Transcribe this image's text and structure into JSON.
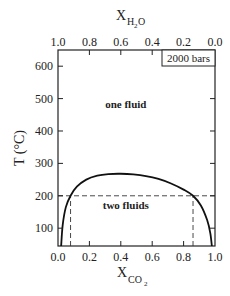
{
  "chart_data": {
    "type": "line",
    "title": "",
    "annotation_box": "2000 bars",
    "xlabel": "X_CO2",
    "xlabel_main": "X",
    "xlabel_sub": "CO",
    "xlabel_subsub": "2",
    "x2label": "X_H2O",
    "x2label_main": "X",
    "x2label_sub": "H",
    "x2label_subsub": "2",
    "x2label_sub_tail": "O",
    "ylabel": "T (°C)",
    "xlim": [
      0.0,
      1.0
    ],
    "ylim": [
      45,
      650
    ],
    "x_ticks": [
      0.0,
      0.2,
      0.4,
      0.6,
      0.8,
      1.0
    ],
    "x_tick_labels": [
      "0.0",
      "0.2",
      "0.4",
      "0.6",
      "0.8",
      "1.0"
    ],
    "x2_ticks": [
      1.0,
      0.8,
      0.6,
      0.4,
      0.2,
      0.0
    ],
    "x2_tick_labels": [
      "1.0",
      "0.8",
      "0.6",
      "0.4",
      "0.2",
      "0.0"
    ],
    "y_ticks": [
      100,
      200,
      300,
      400,
      500,
      600
    ],
    "y_tick_labels": [
      "100",
      "200",
      "300",
      "400",
      "500",
      "600"
    ],
    "grid": false,
    "regions": [
      {
        "label": "one fluid",
        "x": 0.4,
        "y": 470
      },
      {
        "label": "two fluids",
        "x": 0.4,
        "y": 160
      }
    ],
    "series": [
      {
        "name": "solvus (2000 bars)",
        "style": "solid",
        "x": [
          0.02,
          0.03,
          0.05,
          0.08,
          0.12,
          0.18,
          0.25,
          0.32,
          0.4,
          0.48,
          0.56,
          0.64,
          0.72,
          0.8,
          0.86,
          0.91,
          0.95,
          0.97,
          0.98
        ],
        "y": [
          45,
          110,
          165,
          200,
          228,
          250,
          262,
          267,
          268,
          266,
          261,
          252,
          238,
          219,
          200,
          170,
          125,
          85,
          45
        ]
      }
    ],
    "reference_lines": [
      {
        "type": "horizontal",
        "style": "dashed",
        "y": 200,
        "x_range": [
          0.0,
          1.0
        ]
      },
      {
        "type": "vertical",
        "style": "dashed",
        "x": 0.08,
        "y_range": [
          45,
          200
        ]
      },
      {
        "type": "vertical",
        "style": "dashed",
        "x": 0.86,
        "y_range": [
          45,
          200
        ]
      }
    ]
  },
  "colors": {
    "axis": "#222222",
    "curve": "#111111",
    "dashed": "#333333",
    "background": "#ffffff"
  }
}
